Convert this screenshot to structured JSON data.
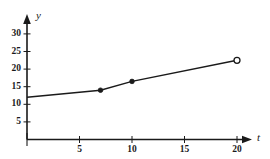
{
  "chart_data": {
    "type": "line",
    "title": "",
    "subtitle": "",
    "xlabel": "t",
    "ylabel": "y",
    "xlim": [
      0,
      22.5
    ],
    "ylim": [
      0,
      32
    ],
    "grid": false,
    "legend": null,
    "x_ticks": [
      5,
      10,
      15,
      20
    ],
    "y_ticks": [
      5,
      10,
      15,
      20,
      25,
      30
    ],
    "x_tick_labels": [
      "5",
      "10",
      "15",
      "20"
    ],
    "y_tick_labels": [
      "5",
      "10",
      "15",
      "20",
      "25",
      "30"
    ],
    "series": [
      {
        "name": "y(t)",
        "x": [
          0,
          7,
          10,
          20
        ],
        "values": [
          12,
          14,
          16.5,
          22.5
        ],
        "markers": [
          "none",
          "filled",
          "filled",
          "open"
        ],
        "color": "#1a1a1a",
        "line_width": 1.4
      }
    ],
    "annotations": []
  },
  "axes": {
    "y_axis_name": "y",
    "x_axis_name": "t",
    "y_arrow": "up-arrow",
    "x_arrow": "right-arrow"
  },
  "style": {
    "axis_color": "#1a1a1a",
    "line_color": "#1a1a1a",
    "background": "#ffffff",
    "tick_color": "#1a1a1a"
  }
}
